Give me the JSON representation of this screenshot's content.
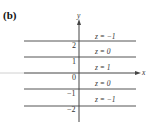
{
  "panel_label": "(b)",
  "axes": {
    "x_label": "x",
    "y_label": "y"
  },
  "y_ticks": [
    "2",
    "1",
    "0",
    "−1",
    "−2"
  ],
  "level_curves": [
    {
      "label": "z = −1"
    },
    {
      "label": "z = 0"
    },
    {
      "label": "z = 1"
    },
    {
      "label": "z = 0"
    },
    {
      "label": "z = −1"
    }
  ],
  "colors": {
    "line": "#555555",
    "axis": "#444444",
    "faint_axis": "#cccccc"
  }
}
